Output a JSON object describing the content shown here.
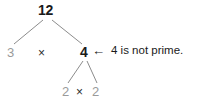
{
  "diagram": {
    "type": "factor-tree",
    "background_color": "#ffffff",
    "colors": {
      "composite_number": "#1a1a1a",
      "factor_number": "#9a9a9a",
      "operator": "#2b2b2b",
      "branch_line": "#8c8c8c",
      "annotation_text": "#1a1a1a"
    },
    "nodes": {
      "root": "12",
      "left_factor": "3",
      "right_factor": "4",
      "leaf_left": "2",
      "leaf_right": "2"
    },
    "operators": {
      "top_multiply": "×",
      "bottom_multiply": "×"
    },
    "arrow": "←",
    "annotation": "4 is not prime.",
    "branches": [
      {
        "from": "12",
        "to": "3"
      },
      {
        "from": "12",
        "to": "4"
      },
      {
        "from": "4",
        "to": "2"
      },
      {
        "from": "4",
        "to": "2"
      }
    ]
  }
}
